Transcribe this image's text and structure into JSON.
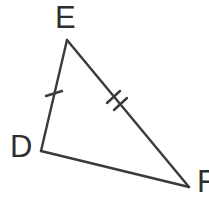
{
  "figure": {
    "kind": "geometry-diagram",
    "shape": "triangle",
    "name": "Triangle DEF",
    "background_color": "#FFFFFF",
    "stroke_color": "#3A3A3A",
    "label_color": "#2F2F2F",
    "stroke_width": 2.4,
    "canvas": {
      "width": 209,
      "height": 201
    }
  },
  "labels": {
    "e": "E",
    "d": "D",
    "f": "F"
  },
  "vertices": [
    {
      "id": "E",
      "label": "E",
      "x": 67,
      "y": 40
    },
    {
      "id": "D",
      "label": "D",
      "x": 41,
      "y": 151
    },
    {
      "id": "F",
      "label": "F",
      "x": 189,
      "y": 187
    }
  ],
  "sides": [
    {
      "id": "DE",
      "from": "D",
      "to": "E",
      "tick_marks": 1
    },
    {
      "id": "EF",
      "from": "E",
      "to": "F",
      "tick_marks": 2
    },
    {
      "id": "DF",
      "from": "D",
      "to": "F",
      "tick_marks": 0
    }
  ],
  "tick_marks": [
    {
      "side": "DE",
      "count": 1,
      "strokes": [
        {
          "x1": 46,
          "y1": 96,
          "x2": 62,
          "y2": 91
        }
      ]
    },
    {
      "side": "EF",
      "count": 2,
      "strokes": [
        {
          "x1": 107,
          "y1": 103,
          "x2": 120,
          "y2": 91
        },
        {
          "x1": 114,
          "y1": 110,
          "x2": 127,
          "y2": 98
        }
      ]
    }
  ],
  "notes": {
    "congruence": "Side DE has one tick and side EF has two ticks, marking them as distinct side lengths.",
    "f_label_clipped": "The F label is cut off at the right edge of the image."
  }
}
